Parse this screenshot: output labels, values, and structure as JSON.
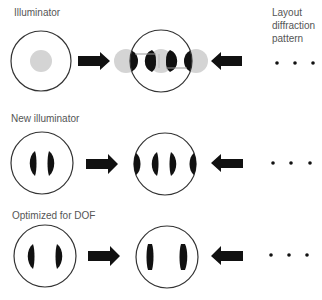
{
  "labels": {
    "row1_title": "Illuminator",
    "layout_title": "Layout diffraction pattern",
    "row2_title": "New illuminator",
    "row3_title": "Optimized for DOF"
  },
  "colors": {
    "outline": "#333333",
    "gray_pole": "#d4d4d4",
    "black_fill": "#111111",
    "text": "#555555"
  },
  "rows": [
    {
      "name": "illuminator",
      "illuminator_circle": {
        "cx": 41,
        "cy": 61,
        "r": 30
      },
      "pupil_circle": {
        "cx": 161,
        "cy": 61,
        "r": 31
      },
      "diffraction_dots_x": [
        277,
        295,
        313
      ],
      "diffraction_dots_y": 63
    },
    {
      "name": "new-illuminator",
      "illuminator_circle": {
        "cx": 42,
        "cy": 163,
        "r": 31
      },
      "pupil_circle": {
        "cx": 165,
        "cy": 164,
        "r": 31
      },
      "diffraction_dots_x": [
        273,
        291,
        310
      ],
      "diffraction_dots_y": 163
    },
    {
      "name": "optimized-for-dof",
      "illuminator_circle": {
        "cx": 45,
        "cy": 256,
        "r": 31
      },
      "pupil_circle": {
        "cx": 167,
        "cy": 257,
        "r": 31
      },
      "diffraction_dots_x": [
        271,
        289,
        307
      ],
      "diffraction_dots_y": 255
    }
  ]
}
